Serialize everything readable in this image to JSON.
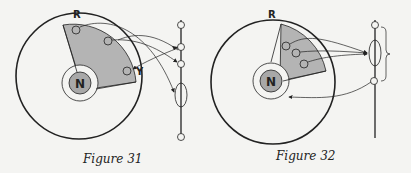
{
  "figures": [
    {
      "caption": "Figure 31",
      "labels": {
        "top": "R",
        "nucleus": "N",
        "side": "Y"
      },
      "colors": {
        "shade": "#b4b4b4",
        "stroke": "#222222",
        "nucleus": "#a8a8a8"
      }
    },
    {
      "caption": "Figure 32",
      "labels": {
        "top": "R",
        "nucleus": "N"
      },
      "colors": {
        "shade": "#b4b4b4",
        "stroke": "#222222",
        "nucleus": "#a8a8a8"
      }
    }
  ]
}
